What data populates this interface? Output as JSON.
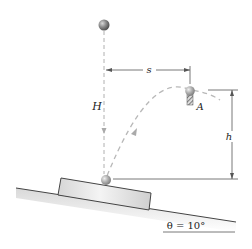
{
  "diagram": {
    "type": "physics-projectile-on-incline",
    "labels": {
      "H": "H",
      "s": "s",
      "h": "h",
      "A": "A",
      "theta": "θ = 10°"
    },
    "elements": {
      "top_ball": "ball dropped from height H",
      "bottom_ball": "ball bouncing on block",
      "ball_A": "ball at apex resting on support A",
      "block": "block on inclined plane",
      "incline": "inclined plane at angle θ"
    },
    "colors": {
      "ball": "#6f6f6f",
      "ball_highlight": "#bdbdbd",
      "dashed": "#b8b8b8",
      "line": "#555555",
      "block_fill": "#e4e4e4"
    }
  }
}
